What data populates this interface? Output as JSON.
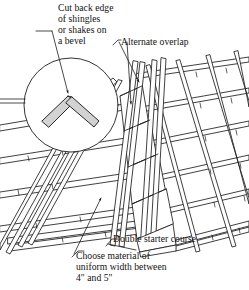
{
  "figure": {
    "type": "line-art technical illustration",
    "background_color": "#ffffff",
    "line_color": "#1d1d1d",
    "fill_color": "#ffffff",
    "shade_color": "#cfcfcf"
  },
  "callouts": {
    "cut_back_edge": {
      "lines": [
        "Cut back edge",
        "of shingles",
        "or shakes on",
        "a bevel"
      ],
      "text": "Cut back edge of shingles or shakes on a bevel"
    },
    "alternate_overlap": {
      "lines": [
        "Alternate overlap"
      ],
      "text": "Alternate overlap"
    },
    "double_starter_course": {
      "lines": [
        "Double starter course"
      ],
      "text": "Double starter course"
    },
    "choose_material": {
      "lines": [
        "Choose material of",
        "uniform width between",
        "4\" and 5\""
      ],
      "text": "Choose material of uniform width between 4\" and 5\""
    }
  },
  "detail_circle": {
    "name": "bevel-cut-detail",
    "description": "magnified view of two shingle edges cut on a bevel meeting at the hip apex"
  },
  "dimensions": {
    "width": 249,
    "height": 290
  }
}
